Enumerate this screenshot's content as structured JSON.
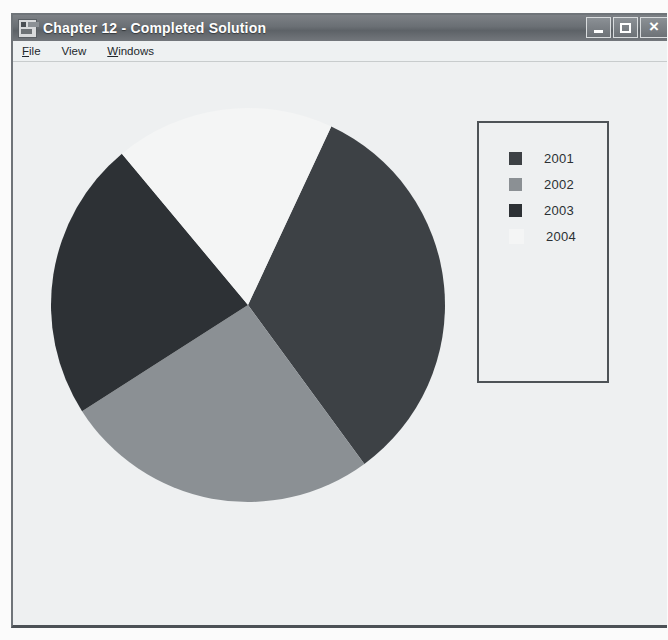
{
  "window": {
    "title": "Chapter 12 - Completed Solution",
    "icon": "form-designer-icon",
    "controls": {
      "minimize_label": "_",
      "maximize_label": "□",
      "close_label": "×"
    }
  },
  "menu": {
    "items": [
      {
        "label": "File",
        "accel": "F",
        "rest": "ile"
      },
      {
        "label": "View",
        "accel": "V",
        "rest": "iew"
      },
      {
        "label": "Windows",
        "accel": "W",
        "rest": "indows"
      }
    ]
  },
  "chart_data": {
    "type": "pie",
    "title": "",
    "categories": [
      "2001",
      "2002",
      "2003",
      "2004"
    ],
    "values": [
      33,
      26,
      23,
      18
    ],
    "percentages": [
      33,
      26,
      23,
      18
    ],
    "colors": [
      "#3d4145",
      "#8b9094",
      "#2d3135",
      "#f4f5f5"
    ],
    "start_angle_deg": -65,
    "direction": "clockwise",
    "legend": {
      "position": "right",
      "border_color": "#4e5357",
      "entries": [
        {
          "label": "2001",
          "color": "#3d4145"
        },
        {
          "label": "2002",
          "color": "#8b9094"
        },
        {
          "label": "2003",
          "color": "#2d3135"
        },
        {
          "label": "2004",
          "color": "#f4f5f5"
        }
      ]
    },
    "geometry": {
      "center_x": 235,
      "center_y": 243,
      "radius": 197
    }
  },
  "colors": {
    "window_background": "#eef0f1",
    "titlebar": "#6a6f74",
    "menubar": "#eef1f2"
  }
}
